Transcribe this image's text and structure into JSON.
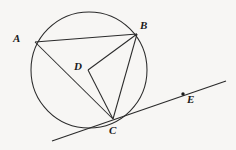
{
  "figure": {
    "type": "circle-geometry-diagram",
    "background_color": "#f7f6f4",
    "stroke_color": "#2b2b2b",
    "label_color": "#1a1a1a",
    "width": 236,
    "height": 150,
    "circle": {
      "name": "circle-D",
      "center": {
        "x": 89,
        "y": 70
      },
      "radius": 58
    },
    "points": [
      {
        "id": "A",
        "label": "A",
        "x": 35,
        "y": 42,
        "on_circle": true,
        "dot": false,
        "label_x": 13,
        "label_y": 33
      },
      {
        "id": "B",
        "label": "B",
        "x": 137,
        "y": 34,
        "on_circle": true,
        "dot": false,
        "label_x": 140,
        "label_y": 20
      },
      {
        "id": "D",
        "label": "D",
        "x": 88,
        "y": 70,
        "on_circle": false,
        "dot": false,
        "label_x": 74,
        "label_y": 61
      },
      {
        "id": "C",
        "label": "C",
        "x": 113,
        "y": 119,
        "on_circle": true,
        "dot": false,
        "label_x": 109,
        "label_y": 125
      },
      {
        "id": "E",
        "label": "E",
        "x": 183,
        "y": 94,
        "on_circle": false,
        "dot": true,
        "label_x": 187,
        "label_y": 94
      }
    ],
    "segments": [
      {
        "name": "segment-AB",
        "from": "A",
        "to": "B",
        "x1": 35,
        "y1": 42,
        "x2": 137,
        "y2": 34
      },
      {
        "name": "segment-AC",
        "from": "A",
        "to": "C",
        "x1": 35,
        "y1": 42,
        "x2": 113,
        "y2": 119
      },
      {
        "name": "segment-BC",
        "from": "B",
        "to": "C",
        "x1": 137,
        "y1": 34,
        "x2": 113,
        "y2": 119
      },
      {
        "name": "segment-DB",
        "from": "D",
        "to": "B",
        "x1": 88,
        "y1": 70,
        "x2": 137,
        "y2": 34
      },
      {
        "name": "segment-DC",
        "from": "D",
        "to": "C",
        "x1": 88,
        "y1": 70,
        "x2": 113,
        "y2": 119
      }
    ],
    "tangent_line": {
      "name": "tangent-line-CE",
      "through_points": [
        "C",
        "E"
      ],
      "x1": 52,
      "y1": 141,
      "x2": 226,
      "y2": 81
    }
  }
}
